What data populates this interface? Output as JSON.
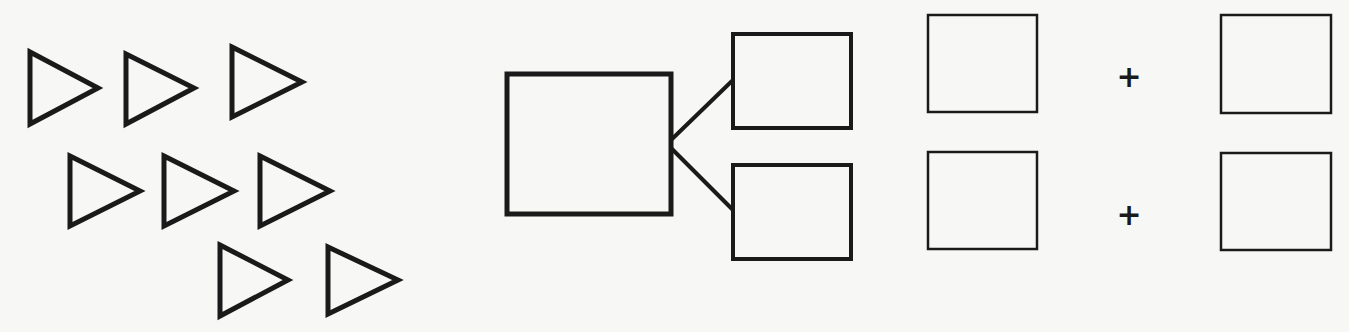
{
  "colors": {
    "background": "#f7f7f6",
    "stroke": "#1a1a1a"
  },
  "triangles": {
    "count": 8,
    "rows": [
      3,
      3,
      2
    ],
    "items": [
      {
        "x": 30,
        "y": 52
      },
      {
        "x": 126,
        "y": 52
      },
      {
        "x": 232,
        "y": 46
      },
      {
        "x": 70,
        "y": 155
      },
      {
        "x": 164,
        "y": 155
      },
      {
        "x": 260,
        "y": 155
      },
      {
        "x": 220,
        "y": 245
      },
      {
        "x": 328,
        "y": 245
      }
    ]
  },
  "number_bond": {
    "whole_box": {
      "x": 507,
      "y": 74,
      "w": 164,
      "h": 140
    },
    "part_boxes": [
      {
        "x": 733,
        "y": 34,
        "w": 118,
        "h": 94
      },
      {
        "x": 733,
        "y": 165,
        "w": 118,
        "h": 94
      }
    ]
  },
  "equations": [
    {
      "left_box": {
        "x": 928,
        "y": 15,
        "w": 109,
        "h": 97
      },
      "operator": "+",
      "right_box": {
        "x": 1221,
        "y": 15,
        "w": 110,
        "h": 98
      }
    },
    {
      "left_box": {
        "x": 928,
        "y": 152,
        "w": 109,
        "h": 97
      },
      "operator": "+",
      "right_box": {
        "x": 1221,
        "y": 153,
        "w": 110,
        "h": 97
      }
    }
  ]
}
